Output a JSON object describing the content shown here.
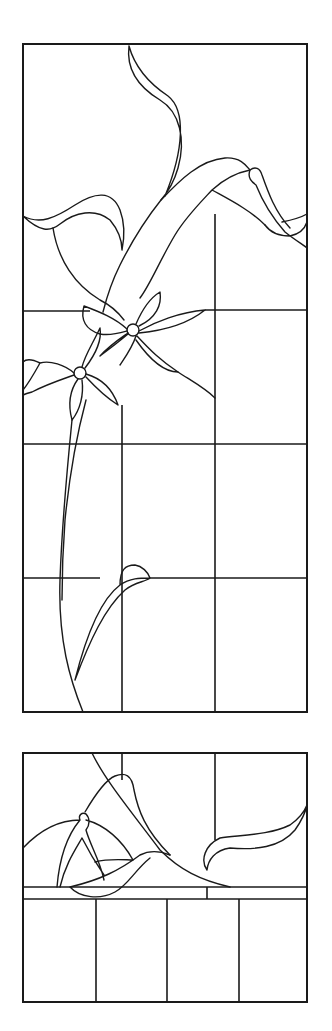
{
  "figure": {
    "title": "",
    "line_color": "#1a1a1a",
    "background": "#ffffff"
  },
  "panels": [
    {
      "name": "upper-panel",
      "bounds": {
        "x": 23,
        "y": 44,
        "width": 284,
        "height": 668
      },
      "grid_verticals": [
        122,
        215
      ],
      "grid_horizontals": [
        311,
        444,
        578
      ],
      "motifs": [
        "curling-leaf",
        "lily-trumpet",
        "bud",
        "open-flower-1",
        "open-flower-2",
        "stem",
        "lower-leaf"
      ]
    },
    {
      "name": "lower-panel",
      "bounds": {
        "x": 23,
        "y": 753,
        "width": 284,
        "height": 249
      },
      "grid_verticals": [
        96,
        167,
        239
      ],
      "ledge_lines": [
        887,
        899
      ],
      "motifs": [
        "bud",
        "lily-trumpet",
        "wave-leaf",
        "right-curl-leaf"
      ]
    }
  ]
}
